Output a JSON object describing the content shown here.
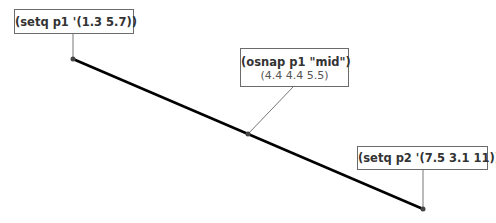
{
  "diagram": {
    "line": {
      "start": {
        "x": 73,
        "y": 59
      },
      "mid": {
        "x": 248,
        "y": 134
      },
      "end": {
        "x": 423,
        "y": 209
      },
      "color": "#000000"
    },
    "labels": [
      {
        "id": "p1",
        "text": "(setq p1 '(1.3 5.7))",
        "sub": ""
      },
      {
        "id": "mid",
        "text": "(osnap p1 \"mid\")",
        "sub": "(4.4 4.4 5.5)"
      },
      {
        "id": "p2",
        "text": "(setq p2 '(7.5 3.1 11))",
        "sub": ""
      }
    ],
    "colors": {
      "box_border": "#6b6b6b",
      "leader": "#777777",
      "line": "#000000"
    }
  }
}
